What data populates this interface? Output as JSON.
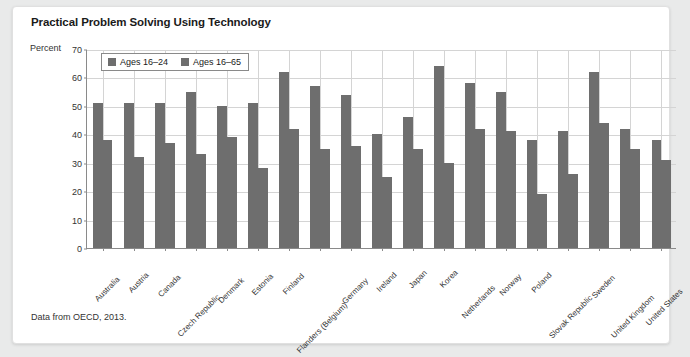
{
  "card": {
    "title": "Practical Problem Solving Using Technology",
    "source_note": "Data from OECD, 2013."
  },
  "chart_data": {
    "type": "bar",
    "title": "Practical Problem Solving Using Technology",
    "xlabel": "",
    "ylabel": "Percent",
    "ylim": [
      0,
      70
    ],
    "yticks": [
      0,
      10,
      20,
      30,
      40,
      50,
      60,
      70
    ],
    "grid": true,
    "legend_position": "top-left",
    "bar_color": "#6e6e6e",
    "categories": [
      "Australia",
      "Austria",
      "Canada",
      "Czech Republic",
      "Denmark",
      "Estonia",
      "Finland",
      "Flanders (Belgium)",
      "Germany",
      "Ireland",
      "Japan",
      "Korea",
      "Netherlands",
      "Norway",
      "Poland",
      "Slovak Republic",
      "Sweden",
      "United Kingdom",
      "United States"
    ],
    "series": [
      {
        "name": "Ages 16–24",
        "values": [
          51,
          51,
          51,
          55,
          50,
          51,
          62,
          57,
          54,
          40,
          46,
          64,
          58,
          55,
          38,
          41,
          62,
          42,
          38
        ]
      },
      {
        "name": "Ages 16–65",
        "values": [
          38,
          32,
          37,
          33,
          39,
          28,
          42,
          35,
          36,
          25,
          35,
          30,
          42,
          41,
          19,
          26,
          44,
          35,
          31
        ]
      }
    ]
  }
}
